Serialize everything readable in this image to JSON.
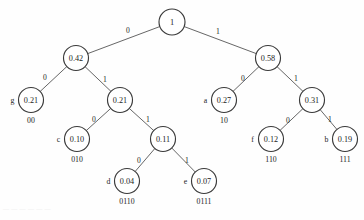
{
  "figure": {
    "kind": "huffman-coding-tree",
    "footer_note": "— — — — — —"
  },
  "nodes": [
    {
      "id": "root",
      "value": "1",
      "symbol": "",
      "code": "",
      "cx": 172,
      "cy": 22,
      "r": 13,
      "is_leaf": false
    },
    {
      "id": "n042",
      "value": "0.42",
      "symbol": "",
      "code": "",
      "cx": 76,
      "cy": 58,
      "r": 12.5,
      "is_leaf": false
    },
    {
      "id": "n058",
      "value": "0.58",
      "symbol": "",
      "code": "",
      "cx": 268,
      "cy": 58,
      "r": 12.5,
      "is_leaf": false
    },
    {
      "id": "g",
      "value": "0.21",
      "symbol": "g",
      "code": "00",
      "cx": 31,
      "cy": 100,
      "r": 12.5,
      "is_leaf": true
    },
    {
      "id": "n021",
      "value": "0.21",
      "symbol": "",
      "code": "",
      "cx": 120,
      "cy": 100,
      "r": 12.5,
      "is_leaf": false
    },
    {
      "id": "a",
      "value": "0.27",
      "symbol": "a",
      "code": "10",
      "cx": 224,
      "cy": 100,
      "r": 12.5,
      "is_leaf": true
    },
    {
      "id": "n031",
      "value": "0.31",
      "symbol": "",
      "code": "",
      "cx": 312,
      "cy": 100,
      "r": 12.5,
      "is_leaf": false
    },
    {
      "id": "c",
      "value": "0.10",
      "symbol": "c",
      "code": "010",
      "cx": 77,
      "cy": 139,
      "r": 12.5,
      "is_leaf": true
    },
    {
      "id": "n011",
      "value": "0.11",
      "symbol": "",
      "code": "",
      "cx": 163,
      "cy": 139,
      "r": 12.5,
      "is_leaf": false
    },
    {
      "id": "f",
      "value": "0.12",
      "symbol": "f",
      "code": "110",
      "cx": 271,
      "cy": 139,
      "r": 12.5,
      "is_leaf": true
    },
    {
      "id": "b",
      "value": "0.19",
      "symbol": "b",
      "code": "111",
      "cx": 345,
      "cy": 139,
      "r": 12.5,
      "is_leaf": true
    },
    {
      "id": "d",
      "value": "0.04",
      "symbol": "d",
      "code": "0110",
      "cx": 127,
      "cy": 181,
      "r": 12.5,
      "is_leaf": true
    },
    {
      "id": "e",
      "value": "0.07",
      "symbol": "e",
      "code": "0111",
      "cx": 204,
      "cy": 181,
      "r": 12.5,
      "is_leaf": true
    }
  ],
  "edges": [
    {
      "from": "root",
      "to": "n042",
      "bit": "0",
      "lx": 128,
      "ly": 30
    },
    {
      "from": "root",
      "to": "n058",
      "bit": "1",
      "lx": 218,
      "ly": 31
    },
    {
      "from": "n042",
      "to": "g",
      "bit": "0",
      "lx": 45,
      "ly": 77
    },
    {
      "from": "n042",
      "to": "n021",
      "bit": "1",
      "lx": 105,
      "ly": 79
    },
    {
      "from": "n058",
      "to": "a",
      "bit": "0",
      "lx": 243,
      "ly": 78
    },
    {
      "from": "n058",
      "to": "n031",
      "bit": "1",
      "lx": 296,
      "ly": 78
    },
    {
      "from": "n021",
      "to": "c",
      "bit": "0",
      "lx": 94,
      "ly": 119
    },
    {
      "from": "n021",
      "to": "n011",
      "bit": "1",
      "lx": 148,
      "ly": 119
    },
    {
      "from": "n031",
      "to": "f",
      "bit": "0",
      "lx": 288,
      "ly": 120
    },
    {
      "from": "n031",
      "to": "b",
      "bit": "1",
      "lx": 330,
      "ly": 119
    },
    {
      "from": "n011",
      "to": "d",
      "bit": "0",
      "lx": 139,
      "ly": 160
    },
    {
      "from": "n011",
      "to": "e",
      "bit": "1",
      "lx": 187,
      "ly": 160
    }
  ],
  "chart_data": {
    "type": "tree",
    "symbols": [
      "a",
      "b",
      "c",
      "d",
      "e",
      "f",
      "g"
    ],
    "probabilities": [
      0.27,
      0.19,
      0.1,
      0.04,
      0.07,
      0.12,
      0.21
    ],
    "codes": [
      "10",
      "111",
      "010",
      "0110",
      "0111",
      "110",
      "00"
    ],
    "internal_nodes": [
      {
        "value": 1.0,
        "children": [
          "0.42",
          "0.58"
        ]
      },
      {
        "value": 0.42,
        "children": [
          "0.21(g)",
          "0.21"
        ]
      },
      {
        "value": 0.58,
        "children": [
          "0.27(a)",
          "0.31"
        ]
      },
      {
        "value": 0.21,
        "children": [
          "0.10(c)",
          "0.11"
        ]
      },
      {
        "value": 0.31,
        "children": [
          "0.12(f)",
          "0.19(b)"
        ]
      },
      {
        "value": 0.11,
        "children": [
          "0.04(d)",
          "0.07(e)"
        ]
      }
    ],
    "edge_labels": [
      "0",
      "1"
    ],
    "root_value": 1.0
  }
}
